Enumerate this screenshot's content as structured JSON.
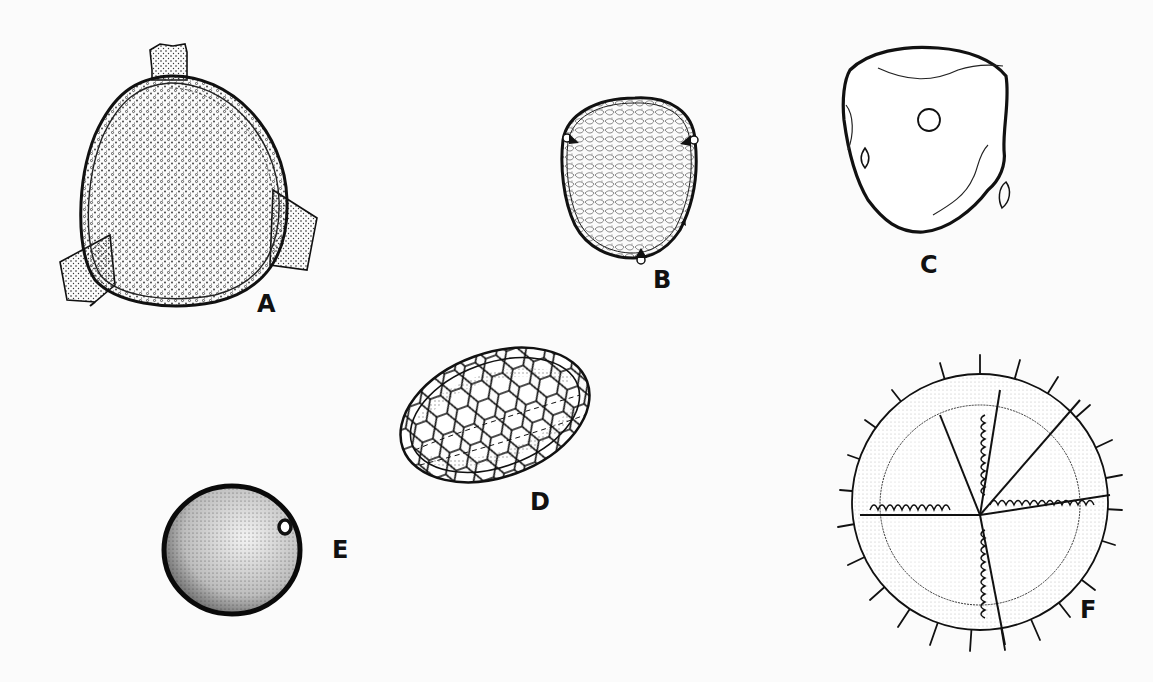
{
  "plate": {
    "background": "#fbfbfb",
    "ink_color": "#111111",
    "figures": [
      {
        "label": "A",
        "description": "triangular spore with three rounded lobes, densely granular/verrucate surface, thick layered wall"
      },
      {
        "label": "B",
        "description": "subtriangular-ovoid pollen grain with reticulate-scabrate surface and three small pores at angles"
      },
      {
        "label": "C",
        "description": "smooth subtriangular grain outline with single circular pore and folds"
      },
      {
        "label": "D",
        "description": "elliptical grain with polygonal reticulum (honeycomb network) in oblique view"
      },
      {
        "label": "E",
        "description": "spherical punctate grain with one small pore"
      },
      {
        "label": "F",
        "description": "spiny spore with trilete ridges bearing teeth and radiating spines"
      }
    ]
  }
}
